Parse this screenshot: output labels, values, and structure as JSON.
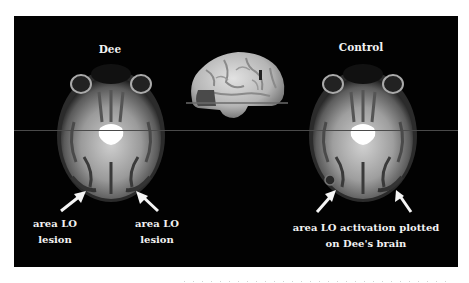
{
  "figure": {
    "background_color": "#020202",
    "text_color": "#f2f2f2",
    "lesion_color": "#4a4a4a",
    "panels": {
      "left": {
        "title": "Dee",
        "image": "axial-mri-slice",
        "annotations": [
          {
            "line1": "area LO",
            "line2": "lesion",
            "arrow": "up-right"
          },
          {
            "line1": "area LO",
            "line2": "lesion",
            "arrow": "up-left"
          }
        ]
      },
      "center": {
        "image": "3d-brain-lateral-view",
        "slice_plane": "horizontal line marking axial slice",
        "highlight": "occipital lesion region"
      },
      "right": {
        "title": "Control",
        "image": "axial-mri-slice",
        "annotation": {
          "line1": "area LO activation plotted",
          "line2": "on Dee's brain"
        }
      }
    }
  }
}
